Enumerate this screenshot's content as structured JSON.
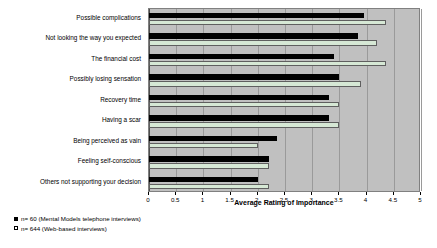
{
  "chart_data": {
    "type": "bar",
    "orientation": "horizontal",
    "title": "",
    "xlabel": "Average Rating of Importance",
    "ylabel": "",
    "xlim": [
      0,
      5
    ],
    "xticks": [
      "0",
      "0.5",
      "1",
      "1.5",
      "2",
      "2.5",
      "3",
      "3.5",
      "4",
      "4.5",
      "5"
    ],
    "xtick_values": [
      0,
      0.5,
      1,
      1.5,
      2,
      2.5,
      3,
      3.5,
      4,
      4.5,
      5
    ],
    "grid": "vertical",
    "legend_position": "below-left",
    "plot_background": "#c0c0c0",
    "categories": [
      "Possible complications",
      "Not looking the way you expected",
      "The financial cost",
      "Possibly losing sensation",
      "Recovery time",
      "Having a scar",
      "Being perceived as vain",
      "Feeling self-conscious",
      "Others not supporting your decision"
    ],
    "series": [
      {
        "name": "n= 60 (Mental Models telephone interviews)",
        "color": "#000000",
        "values": [
          3.95,
          3.85,
          3.4,
          3.5,
          3.3,
          3.3,
          2.35,
          2.2,
          2.0
        ]
      },
      {
        "name": "n= 644 (Web-based interviews)",
        "color": "#d6e8d5",
        "values": [
          4.35,
          4.2,
          4.35,
          3.9,
          3.5,
          3.5,
          2.0,
          2.2,
          2.2
        ]
      }
    ]
  },
  "legend": {
    "items": [
      {
        "marker": "filled-square",
        "label": "n= 60 (Mental Models telephone interviews)"
      },
      {
        "marker": "open-square",
        "label": "n= 644 (Web-based interviews)"
      }
    ]
  }
}
